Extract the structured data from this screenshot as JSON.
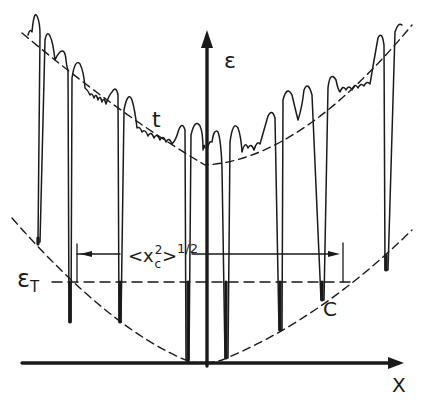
{
  "figure": {
    "axes": {
      "y_label": "ε",
      "x_label": "X"
    },
    "labels": {
      "threshold": "ε",
      "threshold_sub": "T",
      "width_label": "<x",
      "width_sup": "2",
      "width_sub": "c",
      "width_close": ">",
      "width_exp": "1/2",
      "point_c": "C",
      "envelope_t": "t"
    },
    "colors": {
      "ink": "#1a1a1a",
      "background": "#ffffff"
    }
  }
}
